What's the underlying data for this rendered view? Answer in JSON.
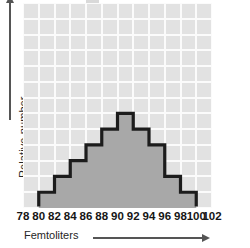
{
  "chart_data": {
    "type": "bar",
    "title": "",
    "subtitle": "",
    "xlabel": "Femtoliters",
    "ylabel": "Relative number",
    "xlabel_arrow": "right-arrow",
    "ylabel_arrow": "up-arrow",
    "grid": true,
    "legend": null,
    "xlim": [
      78,
      102
    ],
    "ylim": [
      0,
      13
    ],
    "xtick_labels": [
      "78",
      "80",
      "82",
      "84",
      "86",
      "88",
      "90",
      "92",
      "94",
      "96",
      "98",
      "100",
      "102"
    ],
    "xtick_values": [
      78,
      80,
      82,
      84,
      86,
      88,
      90,
      92,
      94,
      96,
      98,
      100,
      102
    ],
    "ytick_labels": [],
    "bin_width": 2,
    "bin_edges": [
      80,
      82,
      84,
      86,
      88,
      90,
      92,
      94,
      96,
      98,
      100
    ],
    "categories": [
      "80-82",
      "82-84",
      "84-86",
      "86-88",
      "88-90",
      "90-92",
      "92-94",
      "94-96",
      "96-98",
      "98-100"
    ],
    "values": [
      1,
      2,
      3,
      4,
      5,
      6,
      5,
      4,
      2,
      1
    ],
    "value_units": "grid rows (relative number)",
    "bar_fill_color": "#a8a8a8",
    "bar_outline_color": "#1c1c1c",
    "plot_background_color": "#e2e2e2",
    "gridline_color": "#fbfbfb",
    "axis_color": "#555555",
    "n_grid_columns": 12,
    "n_grid_rows": 13
  },
  "axes": {
    "x": {
      "title": "Femtoliters",
      "ticks": [
        "78",
        "80",
        "82",
        "84",
        "86",
        "88",
        "90",
        "92",
        "94",
        "96",
        "98",
        "100",
        "102"
      ]
    },
    "y": {
      "title": "Relative number"
    }
  }
}
